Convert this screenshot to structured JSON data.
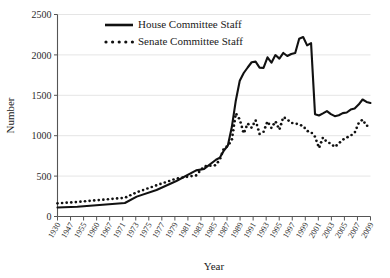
{
  "chart_data": {
    "type": "line",
    "title": "",
    "xlabel": "Year",
    "ylabel": "Number",
    "ylim": [
      0,
      2500
    ],
    "ytick_step": 500,
    "yticks": [
      0,
      500,
      1000,
      1500,
      2000,
      2500
    ],
    "xlim": [
      1930,
      2009
    ],
    "grid": "horizontal",
    "legend_position": "top-center",
    "xtick_labels": [
      "1930",
      "1947",
      "1955",
      "1960",
      "1967",
      "1971",
      "1973",
      "1975",
      "1977",
      "1979",
      "1981",
      "1983",
      "1985",
      "1987",
      "1989",
      "1991",
      "1993",
      "1995",
      "1997",
      "1999",
      "2001",
      "2003",
      "2005",
      "2007",
      "2009"
    ],
    "series": [
      {
        "name": "House Committee Staff",
        "style": "solid",
        "color": "#111111",
        "x": [
          1930,
          1935,
          1947,
          1950,
          1955,
          1960,
          1965,
          1967,
          1970,
          1971,
          1972,
          1973,
          1974,
          1975,
          1976,
          1977,
          1978,
          1979,
          1980,
          1981,
          1982,
          1983,
          1984,
          1985,
          1986,
          1987,
          1988,
          1989,
          1990,
          1991,
          1992,
          1993,
          1994,
          1995,
          1996,
          1997,
          1998,
          1999,
          2000,
          2001,
          2002,
          2003,
          2004,
          2005,
          2006,
          2007,
          2008,
          2009
        ],
        "values": [
          112,
          120,
          167,
          246,
          329,
          440,
          571,
          589,
          702,
          729,
          817,
          878,
          1107,
          1433,
          1680,
          1776,
          1844,
          1909,
          1917,
          1843,
          1839,
          1970,
          1904,
          1998,
          1954,
          2024,
          1986,
          2011,
          2024,
          2201,
          2221,
          2118,
          2146,
          1266,
          1250,
          1276,
          1305,
          1267,
          1242,
          1253,
          1279,
          1287,
          1323,
          1337,
          1385,
          1448,
          1418,
          1405
        ]
      },
      {
        "name": "Senate Committee Staff",
        "style": "dotted",
        "color": "#111111",
        "x": [
          1930,
          1935,
          1947,
          1950,
          1955,
          1960,
          1965,
          1967,
          1970,
          1971,
          1972,
          1973,
          1974,
          1975,
          1976,
          1977,
          1978,
          1979,
          1980,
          1981,
          1982,
          1983,
          1984,
          1985,
          1986,
          1987,
          1988,
          1989,
          1990,
          1991,
          1992,
          1993,
          1994,
          1995,
          1996,
          1997,
          1998,
          1999,
          2000,
          2001,
          2002,
          2003,
          2004,
          2005,
          2006,
          2007,
          2008,
          2009
        ],
        "values": [
          163,
          180,
          232,
          300,
          386,
          470,
          509,
          621,
          635,
          711,
          844,
          873,
          948,
          1277,
          1201,
          1028,
          1151,
          1098,
          1191,
          1022,
          1047,
          1176,
          1095,
          1178,
          1075,
          1231,
          1201,
          1158,
          1154,
          1137,
          1120,
          1059,
          1045,
          987,
          847,
          977,
          921,
          903,
          860,
          905,
          950,
          977,
          1001,
          1036,
          1154,
          1199,
          1121,
          1134
        ]
      }
    ]
  },
  "legend": {
    "entries": [
      {
        "label": "House Committee Staff",
        "style": "solid"
      },
      {
        "label": "Senate Committee Staff",
        "style": "dotted"
      }
    ]
  },
  "axes": {
    "y_title": "Number",
    "x_title": "Year"
  }
}
